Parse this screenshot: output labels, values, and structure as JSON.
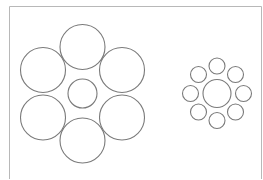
{
  "diagram": {
    "canvas": {
      "width": 263,
      "height": 179,
      "background": "#ffffff"
    },
    "frame": {
      "color": "#b8b8b8",
      "left_x": 9.5,
      "top_y": 6.5,
      "right_x": 261.5,
      "right_bottom_y": 179,
      "left_bottom_y": 179
    },
    "stroke": {
      "color": "#7a7a7a",
      "width": 1.1
    },
    "groups": [
      {
        "name": "large-surround-group",
        "center": {
          "cx": 82.5,
          "cy": 93.5,
          "r": 14.5
        },
        "surround": [
          {
            "cx": 82.5,
            "cy": 47,
            "r": 22.5
          },
          {
            "cx": 122,
            "cy": 70,
            "r": 22.5
          },
          {
            "cx": 122,
            "cy": 117.5,
            "r": 22.5
          },
          {
            "cx": 82.5,
            "cy": 140.5,
            "r": 22.5
          },
          {
            "cx": 43,
            "cy": 117.5,
            "r": 22.5
          },
          {
            "cx": 43,
            "cy": 70,
            "r": 22.5
          }
        ]
      },
      {
        "name": "small-surround-group",
        "center": {
          "cx": 217,
          "cy": 93.5,
          "r": 14
        },
        "surround": [
          {
            "cx": 217,
            "cy": 66,
            "r": 8
          },
          {
            "cx": 235.5,
            "cy": 74.5,
            "r": 8
          },
          {
            "cx": 243.5,
            "cy": 93.5,
            "r": 8
          },
          {
            "cx": 235.5,
            "cy": 112,
            "r": 8
          },
          {
            "cx": 217,
            "cy": 120.5,
            "r": 8
          },
          {
            "cx": 198.5,
            "cy": 112,
            "r": 8
          },
          {
            "cx": 190.5,
            "cy": 93.5,
            "r": 8
          },
          {
            "cx": 198.5,
            "cy": 74.5,
            "r": 8
          }
        ]
      }
    ]
  }
}
